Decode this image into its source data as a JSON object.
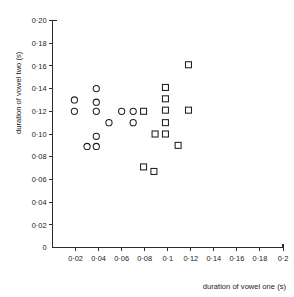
{
  "chart_data": {
    "type": "scatter",
    "title": "",
    "xlabel": "duration of vowel one  (s)",
    "ylabel": "duration of vowel two  (s)",
    "xlim": [
      0,
      0.2
    ],
    "ylim": [
      0,
      0.2
    ],
    "grid": false,
    "legend": "none",
    "decimal_separator": "·",
    "xticks": [
      0,
      0.02,
      0.04,
      0.06,
      0.08,
      0.1,
      0.12,
      0.14,
      0.16,
      0.18,
      0.2
    ],
    "xticklabels": [
      "0",
      "0·02",
      "0·04",
      "0·06",
      "0·08",
      "0·1",
      "0·12",
      "0·14",
      "0·16",
      "0·18",
      "0·2"
    ],
    "yticks": [
      0,
      0.02,
      0.04,
      0.06,
      0.08,
      0.1,
      0.12,
      0.14,
      0.16,
      0.18,
      0.2
    ],
    "yticklabels": [
      "0",
      "0·02",
      "0·04",
      "0·06",
      "0·08",
      "0·10",
      "0·12",
      "0·14",
      "0·16",
      "0·18",
      "0·20"
    ],
    "series": [
      {
        "name": "circles",
        "marker": "circle",
        "color": "#1f1f1f",
        "points": [
          {
            "x": 0.019,
            "y": 0.13
          },
          {
            "x": 0.019,
            "y": 0.12
          },
          {
            "x": 0.038,
            "y": 0.14
          },
          {
            "x": 0.038,
            "y": 0.128
          },
          {
            "x": 0.038,
            "y": 0.12
          },
          {
            "x": 0.038,
            "y": 0.098
          },
          {
            "x": 0.038,
            "y": 0.089
          },
          {
            "x": 0.03,
            "y": 0.089
          },
          {
            "x": 0.049,
            "y": 0.11
          },
          {
            "x": 0.06,
            "y": 0.12
          },
          {
            "x": 0.07,
            "y": 0.12
          },
          {
            "x": 0.07,
            "y": 0.11
          }
        ]
      },
      {
        "name": "squares",
        "marker": "square",
        "color": "#1f1f1f",
        "points": [
          {
            "x": 0.079,
            "y": 0.12
          },
          {
            "x": 0.079,
            "y": 0.071
          },
          {
            "x": 0.088,
            "y": 0.067
          },
          {
            "x": 0.089,
            "y": 0.1
          },
          {
            "x": 0.098,
            "y": 0.141
          },
          {
            "x": 0.098,
            "y": 0.131
          },
          {
            "x": 0.098,
            "y": 0.121
          },
          {
            "x": 0.098,
            "y": 0.11
          },
          {
            "x": 0.098,
            "y": 0.1
          },
          {
            "x": 0.109,
            "y": 0.09
          },
          {
            "x": 0.118,
            "y": 0.161
          },
          {
            "x": 0.118,
            "y": 0.121
          }
        ]
      }
    ]
  }
}
